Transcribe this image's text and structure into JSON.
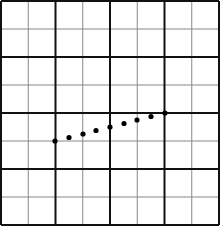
{
  "diagram": {
    "type": "grid-with-dotted-line",
    "background": "#ffffff",
    "grid": {
      "x0": 1,
      "y0": 1,
      "x1": 219,
      "y1": 225,
      "major_cols": 4,
      "major_rows": 4,
      "minor_subdivisions": 2,
      "major_color": "#111111",
      "major_width": 2,
      "minor_color": "#888888",
      "minor_width": 1
    },
    "points": [
      {
        "x": 55,
        "y": 141
      },
      {
        "x": 69,
        "y": 137.5
      },
      {
        "x": 83,
        "y": 134
      },
      {
        "x": 96,
        "y": 130.5
      },
      {
        "x": 110,
        "y": 127
      },
      {
        "x": 124,
        "y": 123.5
      },
      {
        "x": 137,
        "y": 120
      },
      {
        "x": 151,
        "y": 116.5
      },
      {
        "x": 165,
        "y": 113
      }
    ],
    "point_color": "#000000",
    "point_radius": 2.6
  }
}
